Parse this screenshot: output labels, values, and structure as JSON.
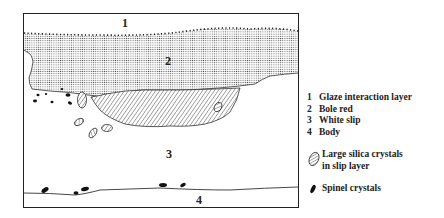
{
  "diagram": {
    "region_labels": {
      "glaze": "1",
      "bole": "2",
      "slip": "3",
      "body": "4"
    }
  },
  "legend": {
    "layers": [
      {
        "num": "1",
        "label": "Glaze interaction layer"
      },
      {
        "num": "2",
        "label": "Bole red"
      },
      {
        "num": "3",
        "label": "White slip"
      },
      {
        "num": "4",
        "label": "Body"
      }
    ],
    "symbols": [
      {
        "icon": "hatched-ellipse-icon",
        "label_line1": "Large silica crystals",
        "label_line2": "in slip layer"
      },
      {
        "icon": "black-ellipse-icon",
        "label": "Spinel crystals"
      }
    ]
  },
  "colors": {
    "ink": "#222222",
    "background": "#ffffff"
  }
}
